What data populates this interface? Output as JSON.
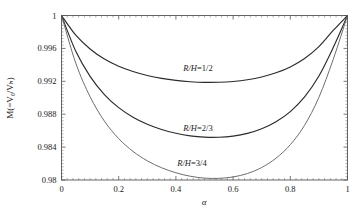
{
  "chart_data": {
    "type": "line",
    "title": "",
    "xlabel": "α",
    "ylabel": "M(=V₀/Vₕ)",
    "ylabel_plain": "M(=V_0/V_H)",
    "xlim": [
      0,
      1
    ],
    "ylim": [
      0.98,
      1
    ],
    "grid": false,
    "legend": "inline-curve-labels",
    "xticks": [
      "0",
      "0.2",
      "0.4",
      "0.6",
      "0.8",
      "1"
    ],
    "xtick_values": [
      0,
      0.2,
      0.4,
      0.6,
      0.8,
      1
    ],
    "yticks": [
      "0.98",
      "0.984",
      "0.988",
      "0.992",
      "0.996",
      "1"
    ],
    "ytick_values": [
      0.98,
      0.984,
      0.988,
      0.992,
      0.996,
      1
    ],
    "x": [
      0,
      0.05,
      0.1,
      0.15,
      0.2,
      0.25,
      0.3,
      0.35,
      0.4,
      0.45,
      0.5,
      0.55,
      0.6,
      0.65,
      0.7,
      0.75,
      0.8,
      0.85,
      0.9,
      0.95,
      1
    ],
    "series": [
      {
        "name": "R/H=1/2",
        "label": "R/H=1/2",
        "color": "#2b2b2b",
        "minimum": {
          "x": 0.48,
          "y": 0.99185
        },
        "values": [
          1,
          0.9976,
          0.99592,
          0.9947,
          0.99383,
          0.99319,
          0.99271,
          0.99236,
          0.99211,
          0.99195,
          0.99187,
          0.99188,
          0.99198,
          0.99219,
          0.99253,
          0.99303,
          0.99375,
          0.99477,
          0.99622,
          0.99818,
          1
        ]
      },
      {
        "name": "R/H=2/3",
        "label": "R/H=2/3",
        "color": "#2b2b2b",
        "minimum": {
          "x": 0.47,
          "y": 0.98455
        },
        "values": [
          1,
          0.99565,
          0.9926,
          0.99039,
          0.9888,
          0.98764,
          0.98678,
          0.98614,
          0.98568,
          0.98537,
          0.98521,
          0.9852,
          0.98534,
          0.98567,
          0.98623,
          0.98708,
          0.98832,
          0.9901,
          0.99264,
          0.9961,
          1
        ]
      },
      {
        "name": "R/H=3/4",
        "label": "R/H=3/4",
        "color": "#6e6e6e",
        "minimum": {
          "x": 0.46,
          "y": 0.9802
        },
        "values": [
          1,
          0.9942,
          0.99012,
          0.98716,
          0.98503,
          0.98348,
          0.98233,
          0.98149,
          0.98088,
          0.98046,
          0.98023,
          0.9802,
          0.98037,
          0.98079,
          0.98152,
          0.98265,
          0.98429,
          0.98666,
          0.99005,
          0.99466,
          1
        ]
      }
    ],
    "curve_label_positions": [
      {
        "label": "R/H=1/2",
        "x_px": 198,
        "y_px": 71
      },
      {
        "label": "R/H=2/3",
        "x_px": 198,
        "y_px": 131
      },
      {
        "label": "R/H=3/4",
        "x_px": 192,
        "y_px": 166
      }
    ]
  }
}
